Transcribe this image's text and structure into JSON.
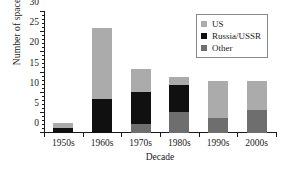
{
  "chart_data": {
    "type": "bar",
    "barmode": "stacked",
    "title": "",
    "xlabel": "Decade",
    "ylabel": "Number of spacecraft",
    "categories": [
      "1950s",
      "1960s",
      "1970s",
      "1980s",
      "1990s",
      "2000s"
    ],
    "ylim": [
      0,
      30
    ],
    "yticks": [
      0,
      5,
      10,
      15,
      20,
      25,
      30
    ],
    "ytick_labels": [
      "0",
      "5",
      "10",
      "15",
      "20",
      "25",
      "30"
    ],
    "yminor_step": 1,
    "grid": false,
    "legend_position": "top-right",
    "series": [
      {
        "name": "Other",
        "color": "#6e6e6e",
        "values": [
          0,
          0,
          2.2,
          5.3,
          3.6,
          5.6
        ]
      },
      {
        "name": "Russia/USSR",
        "color": "#101010",
        "values": [
          1.2,
          8.4,
          7.9,
          6.7,
          0,
          0
        ]
      },
      {
        "name": "US",
        "color": "#ababab",
        "values": [
          1.3,
          17.6,
          5.9,
          2.0,
          9.4,
          7.4
        ]
      }
    ],
    "totals": [
      2.5,
      26.0,
      16.0,
      14.0,
      13.0,
      13.0
    ],
    "legend": [
      {
        "label": "US",
        "color": "#ababab"
      },
      {
        "label": "Russia/USSR",
        "color": "#101010"
      },
      {
        "label": "Other",
        "color": "#6e6e6e"
      }
    ]
  }
}
